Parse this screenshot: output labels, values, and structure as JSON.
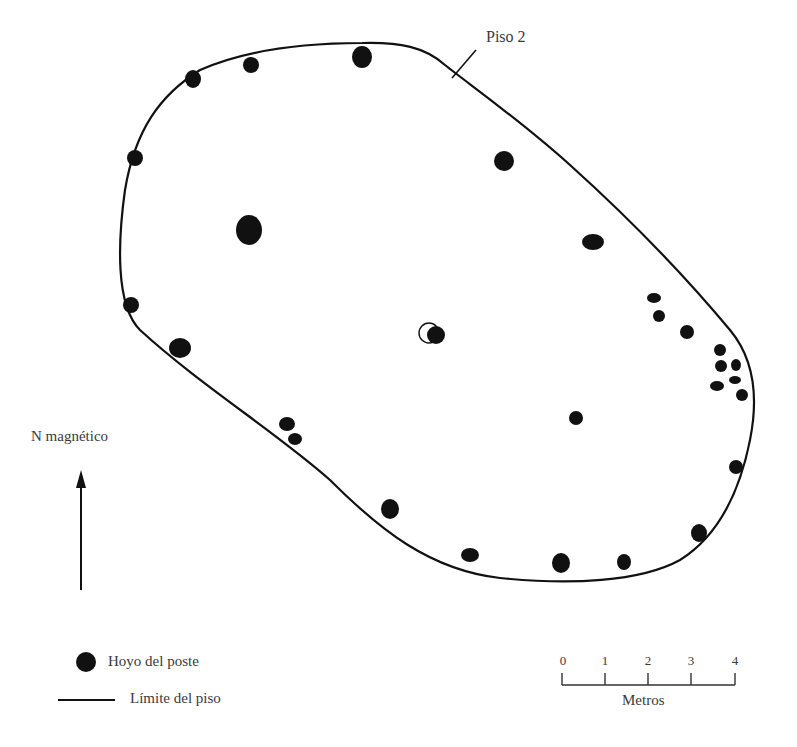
{
  "floor": {
    "label": "Piso 2",
    "outline_color": "#111111",
    "post_color": "#111111"
  },
  "post_holes": [
    {
      "x": 193,
      "y": 79,
      "rx": 8,
      "ry": 9
    },
    {
      "x": 251,
      "y": 65,
      "rx": 8,
      "ry": 8
    },
    {
      "x": 362,
      "y": 57,
      "rx": 10,
      "ry": 11
    },
    {
      "x": 135,
      "y": 158,
      "rx": 8,
      "ry": 8
    },
    {
      "x": 504,
      "y": 161,
      "rx": 10,
      "ry": 10
    },
    {
      "x": 249,
      "y": 230,
      "rx": 13,
      "ry": 15
    },
    {
      "x": 593,
      "y": 242,
      "rx": 11,
      "ry": 8
    },
    {
      "x": 131,
      "y": 305,
      "rx": 8,
      "ry": 8
    },
    {
      "x": 180,
      "y": 348,
      "rx": 11,
      "ry": 10
    },
    {
      "x": 436,
      "y": 335,
      "rx": 9,
      "ry": 9
    },
    {
      "x": 654,
      "y": 298,
      "rx": 7,
      "ry": 5
    },
    {
      "x": 659,
      "y": 316,
      "rx": 6,
      "ry": 6
    },
    {
      "x": 687,
      "y": 332,
      "rx": 7,
      "ry": 7
    },
    {
      "x": 720,
      "y": 350,
      "rx": 6,
      "ry": 6
    },
    {
      "x": 721,
      "y": 366,
      "rx": 6,
      "ry": 6
    },
    {
      "x": 736,
      "y": 365,
      "rx": 5,
      "ry": 6
    },
    {
      "x": 735,
      "y": 380,
      "rx": 6,
      "ry": 4
    },
    {
      "x": 717,
      "y": 386,
      "rx": 7,
      "ry": 5
    },
    {
      "x": 742,
      "y": 395,
      "rx": 6,
      "ry": 6
    },
    {
      "x": 287,
      "y": 424,
      "rx": 8,
      "ry": 7
    },
    {
      "x": 295,
      "y": 439,
      "rx": 7,
      "ry": 6
    },
    {
      "x": 576,
      "y": 418,
      "rx": 7,
      "ry": 7
    },
    {
      "x": 736,
      "y": 467,
      "rx": 7,
      "ry": 7
    },
    {
      "x": 390,
      "y": 509,
      "rx": 9,
      "ry": 10
    },
    {
      "x": 699,
      "y": 533,
      "rx": 8,
      "ry": 9
    },
    {
      "x": 470,
      "y": 555,
      "rx": 9,
      "ry": 7
    },
    {
      "x": 561,
      "y": 563,
      "rx": 9,
      "ry": 10
    },
    {
      "x": 624,
      "y": 562,
      "rx": 7,
      "ry": 8
    }
  ],
  "north_arrow": {
    "label": "N magnético"
  },
  "legend": {
    "items": [
      {
        "symbol": "filled-circle",
        "label": "Hoyo del poste"
      },
      {
        "symbol": "line",
        "label": "Límite del piso"
      }
    ]
  },
  "scale_bar": {
    "ticks": [
      "0",
      "1",
      "2",
      "3",
      "4"
    ],
    "unit_label": "Metros"
  }
}
